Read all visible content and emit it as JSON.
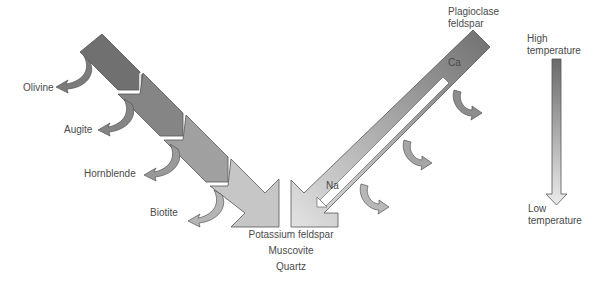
{
  "discontinuous_series": {
    "minerals": [
      "Olivine",
      "Augite",
      "Hornblende",
      "Biotite"
    ]
  },
  "continuous_series": {
    "name": "Plagioclase feldspar",
    "name_line1": "Plagioclase",
    "name_line2": "feldspar",
    "start_label": "Ca",
    "end_label": "Na"
  },
  "final_products": [
    "Potassium feldspar",
    "Muscovite",
    "Quartz"
  ],
  "temperature_scale": {
    "high_line1": "High",
    "high_line2": "temperature",
    "low_line1": "Low",
    "low_line2": "temperature"
  },
  "colors": {
    "dark": "#6e6e6e",
    "mid": "#9a9a9a",
    "light": "#d8d8d8",
    "outline": "#555555"
  }
}
